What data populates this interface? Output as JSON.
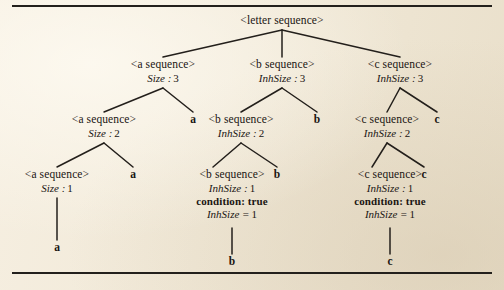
{
  "figure": {
    "background_color": "#f3ecdd",
    "ink_color": "#231f1b",
    "root": {
      "label": "<letter sequence>"
    },
    "nodes": {
      "a3": {
        "label": "<a sequence>",
        "attr_name": "Size",
        "attr_sep": ":",
        "attr_value": "3"
      },
      "b3": {
        "label": "<b sequence>",
        "attr_name": "InhSize",
        "attr_sep": ":",
        "attr_value": "3"
      },
      "c3": {
        "label": "<c sequence>",
        "attr_name": "InhSize",
        "attr_sep": ":",
        "attr_value": "3"
      },
      "a2": {
        "label": "<a sequence>",
        "attr_name": "Size",
        "attr_sep": ":",
        "attr_value": "2"
      },
      "b2": {
        "label": "<b sequence>",
        "attr_name": "InhSize",
        "attr_sep": ":",
        "attr_value": "2"
      },
      "c2": {
        "label": "<c sequence>",
        "attr_name": "InhSize",
        "attr_sep": ":",
        "attr_value": "2"
      },
      "a1": {
        "label": "<a sequence>",
        "attr_name": "Size",
        "attr_sep": ":",
        "attr_value": "1"
      },
      "b1": {
        "label": "<b sequence>",
        "attr_name": "InhSize",
        "attr_sep": ":",
        "attr_value": "1",
        "condition": "condition: true",
        "equation_name": "InhSize",
        "equation_sep": "=",
        "equation_value": "1"
      },
      "c1": {
        "label": "<c sequence>",
        "attr_name": "InhSize",
        "attr_sep": ":",
        "attr_value": "1",
        "condition": "condition: true",
        "equation_name": "InhSize",
        "equation_sep": "=",
        "equation_value": "1"
      }
    },
    "terminals": {
      "a_r3": "a",
      "b_r3": "b",
      "c_r3": "c",
      "a_r2": "a",
      "b_r2": "b",
      "c_r2": "c",
      "a_leaf": "a",
      "b_leaf": "b",
      "c_leaf": "c"
    }
  }
}
